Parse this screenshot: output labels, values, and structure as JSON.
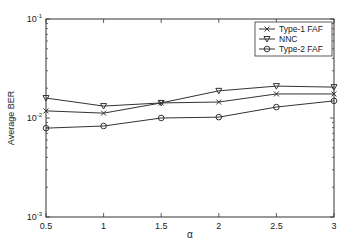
{
  "chart_data": {
    "type": "line",
    "title": "",
    "xlabel": "α",
    "ylabel": "Average BER",
    "x": [
      0.5,
      1,
      1.5,
      2,
      2.5,
      3
    ],
    "xticks": [
      "0.5",
      "1",
      "1.5",
      "2",
      "2.5",
      "3"
    ],
    "xlim": [
      0.5,
      3
    ],
    "yscale": "log",
    "ylim": [
      0.001,
      0.1
    ],
    "yticks": [
      {
        "base": "10",
        "exp": "-1",
        "value": 0.1
      },
      {
        "base": "10",
        "exp": "-2",
        "value": 0.01
      },
      {
        "base": "10",
        "exp": "-3",
        "value": 0.001
      }
    ],
    "grid": false,
    "legend_position": "upper right",
    "series": [
      {
        "name": "Type-1 FAF",
        "marker": "x",
        "values": [
          0.0118,
          0.0112,
          0.0142,
          0.0145,
          0.0175,
          0.0175
        ]
      },
      {
        "name": "NNC",
        "marker": "triangle-down",
        "values": [
          0.0159,
          0.0132,
          0.0142,
          0.0188,
          0.021,
          0.0205
        ]
      },
      {
        "name": "Type-2 FAF",
        "marker": "circle",
        "values": [
          0.0079,
          0.0083,
          0.01,
          0.0102,
          0.0129,
          0.0149
        ]
      }
    ]
  }
}
